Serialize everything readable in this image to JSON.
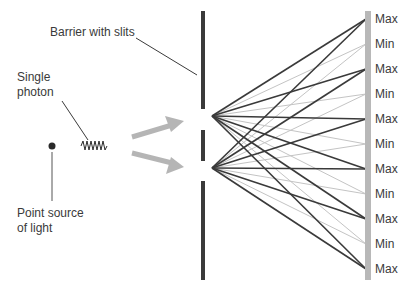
{
  "diagram": {
    "labels": {
      "barrier": "Barrier with slits",
      "photon_line1": "Single",
      "photon_line2": "photon",
      "source_line1": "Point source",
      "source_line2": "of light"
    },
    "screen_points": [
      {
        "label": "Max",
        "y": 19
      },
      {
        "label": "Min",
        "y": 44
      },
      {
        "label": "Max",
        "y": 69
      },
      {
        "label": "Min",
        "y": 94
      },
      {
        "label": "Max",
        "y": 119
      },
      {
        "label": "Min",
        "y": 144
      },
      {
        "label": "Max",
        "y": 169
      },
      {
        "label": "Min",
        "y": 194
      },
      {
        "label": "Max",
        "y": 219
      },
      {
        "label": "Min",
        "y": 244
      },
      {
        "label": "Max",
        "y": 269
      }
    ],
    "slits": [
      {
        "name": "top-slit",
        "x": 212,
        "y": 116
      },
      {
        "name": "bottom-slit",
        "x": 212,
        "y": 168
      }
    ],
    "colors": {
      "barrier": "#3a3a3a",
      "screen": "#b8b8b8",
      "max_line": "#3a3a3a",
      "min_line": "#c4c4c4",
      "arrow": "#b5b5b5",
      "text": "#3a3a3a"
    }
  }
}
